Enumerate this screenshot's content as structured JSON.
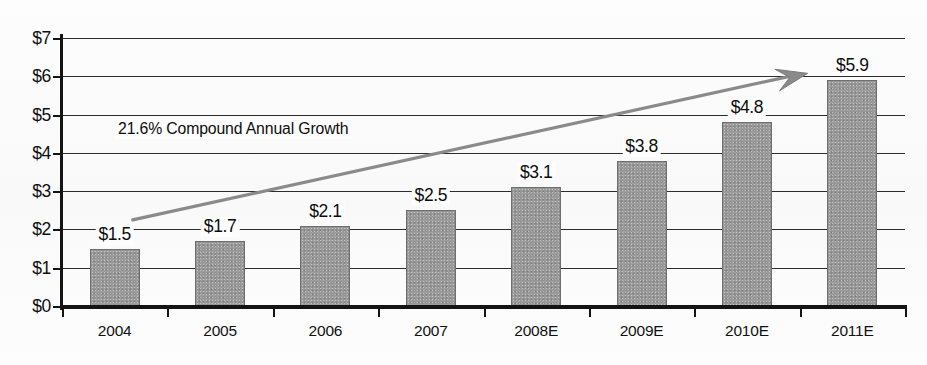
{
  "chart_data": {
    "type": "bar",
    "title": "",
    "subtitle": "",
    "xlabel": "",
    "ylabel": "",
    "categories": [
      "2004",
      "2005",
      "2006",
      "2007",
      "2008E",
      "2009E",
      "2010E",
      "2011E"
    ],
    "values": [
      1.5,
      1.7,
      2.1,
      2.5,
      3.1,
      3.8,
      4.8,
      5.9
    ],
    "data_labels": [
      "$1.5",
      "$1.7",
      "$2.1",
      "$2.5",
      "$3.1",
      "$3.8",
      "$4.8",
      "$5.9"
    ],
    "ylim": [
      0,
      7
    ],
    "ytick_values": [
      0,
      1,
      2,
      3,
      4,
      5,
      6,
      7
    ],
    "ytick_labels": [
      "$0",
      "$1",
      "$2",
      "$3",
      "$4",
      "$5",
      "$6",
      "$7"
    ],
    "grid": true,
    "legend": null,
    "legend_position": "none",
    "annotations": [
      {
        "name": "cagr-note",
        "text": "21.6% Compound Annual Growth"
      },
      {
        "name": "trend-arrow",
        "text": "",
        "from_value": 2.25,
        "to_value": 6.05
      }
    ],
    "colors": {
      "bar_fill": "#9d9d9d",
      "bar_border": "#6f6f6f",
      "axis": "#141414",
      "gridline": "#2c2c2c",
      "arrow": "#8a8a8a",
      "text": "#0d0d0d",
      "background": "#fdfdfd"
    }
  }
}
